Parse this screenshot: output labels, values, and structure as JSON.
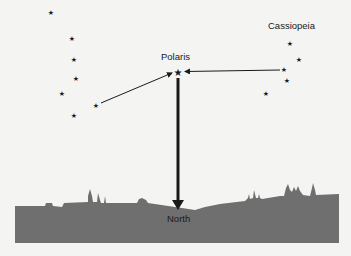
{
  "diagram": {
    "labels": {
      "polaris": "Polaris",
      "cassiopeia": "Cassiopeia",
      "north": "North"
    },
    "colors": {
      "background": "#f4f4f2",
      "stars": "#1a1a1a",
      "arrows": "#1a1a1a",
      "ground": "#6f6f6f"
    },
    "icons": {
      "star": "★"
    },
    "big_dipper_stars": [
      {
        "x": 51,
        "y": 13
      },
      {
        "x": 72,
        "y": 39
      },
      {
        "x": 74,
        "y": 60
      },
      {
        "x": 76,
        "y": 79
      },
      {
        "x": 62,
        "y": 94
      },
      {
        "x": 96,
        "y": 106
      },
      {
        "x": 74,
        "y": 116
      }
    ],
    "polaris_star": {
      "x": 178,
      "y": 72
    },
    "cassiopeia_stars": [
      {
        "x": 290,
        "y": 44
      },
      {
        "x": 299,
        "y": 60
      },
      {
        "x": 284,
        "y": 70
      },
      {
        "x": 287,
        "y": 81
      },
      {
        "x": 266,
        "y": 94
      }
    ]
  }
}
